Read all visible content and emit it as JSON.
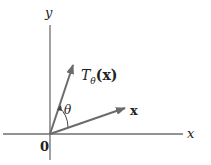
{
  "diagram": {
    "labels": {
      "y_axis": "y",
      "x_axis": "x",
      "origin": "0",
      "vector_x": "x",
      "rotated_vector": "T",
      "rotated_subscript": "θ",
      "rotated_arg": "(x)",
      "angle": "θ"
    },
    "colors": {
      "axis": "#6e6e6e",
      "vector": "#6b6b6b",
      "text": "#222222"
    }
  }
}
